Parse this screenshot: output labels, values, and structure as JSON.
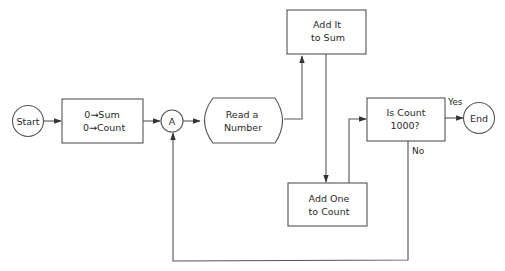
{
  "diagram": {
    "type": "flowchart",
    "nodes": {
      "start": {
        "label": "Start",
        "shape": "circle"
      },
      "init": {
        "line1": "0→Sum",
        "line2": "0→Count",
        "shape": "process"
      },
      "connector_a": {
        "label": "A",
        "shape": "connector"
      },
      "read": {
        "line1": "Read a",
        "line2": "Number",
        "shape": "input"
      },
      "add_sum": {
        "line1": "Add It",
        "line2": "to Sum",
        "shape": "process"
      },
      "add_count": {
        "line1": "Add One",
        "line2": "to Count",
        "shape": "process"
      },
      "decision": {
        "line1": "Is Count",
        "line2": "1000?",
        "shape": "decision-box"
      },
      "end": {
        "label": "End",
        "shape": "circle"
      }
    },
    "edges": [
      {
        "from": "start",
        "to": "init"
      },
      {
        "from": "init",
        "to": "connector_a"
      },
      {
        "from": "connector_a",
        "to": "read"
      },
      {
        "from": "read",
        "to": "add_sum"
      },
      {
        "from": "add_sum",
        "to": "add_count"
      },
      {
        "from": "add_count",
        "to": "decision"
      },
      {
        "from": "decision",
        "to": "end",
        "label": "Yes"
      },
      {
        "from": "decision",
        "to": "connector_a",
        "label": "No"
      }
    ],
    "edge_labels": {
      "yes": "Yes",
      "no": "No"
    },
    "colors": {
      "stroke": "#555555",
      "text": "#2a2a2a",
      "background": "#ffffff"
    }
  }
}
